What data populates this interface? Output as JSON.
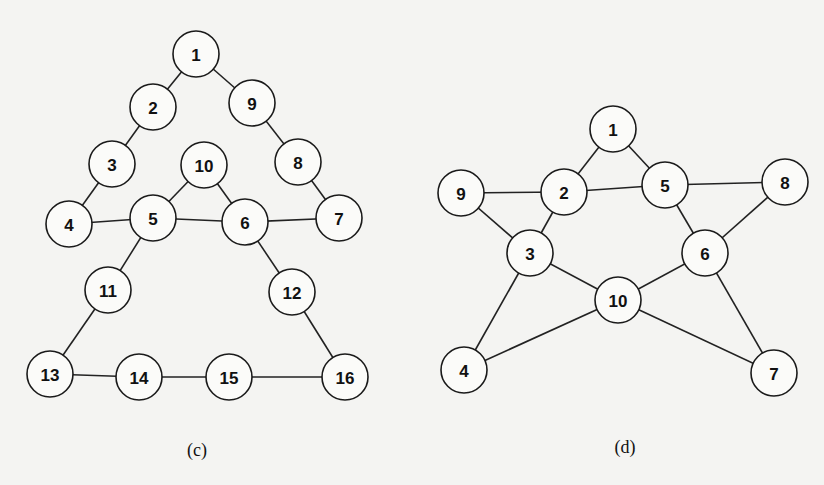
{
  "background": "#f4f4f2",
  "node_radius": 23,
  "graphs": [
    {
      "id": "c",
      "caption": "(c)",
      "caption_pos": [
        197,
        450
      ],
      "nodes": [
        {
          "label": "1",
          "x": 196,
          "y": 54
        },
        {
          "label": "2",
          "x": 153,
          "y": 107
        },
        {
          "label": "3",
          "x": 112,
          "y": 164
        },
        {
          "label": "4",
          "x": 69,
          "y": 224
        },
        {
          "label": "5",
          "x": 153,
          "y": 218
        },
        {
          "label": "6",
          "x": 245,
          "y": 222
        },
        {
          "label": "7",
          "x": 339,
          "y": 218
        },
        {
          "label": "8",
          "x": 298,
          "y": 162
        },
        {
          "label": "9",
          "x": 252,
          "y": 103
        },
        {
          "label": "10",
          "x": 204,
          "y": 165
        },
        {
          "label": "11",
          "x": 108,
          "y": 290
        },
        {
          "label": "12",
          "x": 292,
          "y": 292
        },
        {
          "label": "13",
          "x": 50,
          "y": 374
        },
        {
          "label": "14",
          "x": 139,
          "y": 377
        },
        {
          "label": "15",
          "x": 229,
          "y": 377
        },
        {
          "label": "16",
          "x": 345,
          "y": 377
        }
      ],
      "edges": [
        [
          "1",
          "2"
        ],
        [
          "2",
          "3"
        ],
        [
          "3",
          "4"
        ],
        [
          "4",
          "5"
        ],
        [
          "5",
          "6"
        ],
        [
          "6",
          "7"
        ],
        [
          "7",
          "8"
        ],
        [
          "8",
          "9"
        ],
        [
          "9",
          "1"
        ],
        [
          "5",
          "10"
        ],
        [
          "10",
          "6"
        ],
        [
          "5",
          "11"
        ],
        [
          "11",
          "13"
        ],
        [
          "13",
          "14"
        ],
        [
          "14",
          "15"
        ],
        [
          "15",
          "16"
        ],
        [
          "16",
          "12"
        ],
        [
          "12",
          "6"
        ]
      ]
    },
    {
      "id": "d",
      "caption": "(d)",
      "caption_pos": [
        625,
        447
      ],
      "nodes": [
        {
          "label": "1",
          "x": 613,
          "y": 129
        },
        {
          "label": "2",
          "x": 564,
          "y": 192
        },
        {
          "label": "3",
          "x": 530,
          "y": 253
        },
        {
          "label": "4",
          "x": 464,
          "y": 370
        },
        {
          "label": "5",
          "x": 665,
          "y": 185
        },
        {
          "label": "6",
          "x": 705,
          "y": 253
        },
        {
          "label": "7",
          "x": 774,
          "y": 373
        },
        {
          "label": "8",
          "x": 785,
          "y": 182
        },
        {
          "label": "9",
          "x": 461,
          "y": 193
        },
        {
          "label": "10",
          "x": 618,
          "y": 300
        }
      ],
      "edges": [
        [
          "1",
          "2"
        ],
        [
          "1",
          "5"
        ],
        [
          "2",
          "5"
        ],
        [
          "9",
          "2"
        ],
        [
          "5",
          "8"
        ],
        [
          "9",
          "3"
        ],
        [
          "2",
          "3"
        ],
        [
          "5",
          "6"
        ],
        [
          "8",
          "6"
        ],
        [
          "3",
          "10"
        ],
        [
          "6",
          "10"
        ],
        [
          "3",
          "4"
        ],
        [
          "4",
          "10"
        ],
        [
          "10",
          "7"
        ],
        [
          "6",
          "7"
        ]
      ]
    }
  ]
}
